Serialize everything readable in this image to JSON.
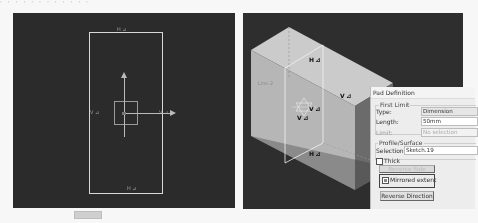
{
  "top_strip": {
    "text": "· · · · · ·   · · · · · ·"
  },
  "sketch_view": {
    "labels": {
      "top": "H ⊿",
      "left": "V ⊿",
      "right": "V ⊿",
      "bottom": "H ⊿"
    },
    "icons": [
      "axis-system-icon",
      "origin-square-icon"
    ]
  },
  "model_view": {
    "face_label": "Line.2",
    "constraints": {
      "top": "H ⊿",
      "right": "V ⊿",
      "center_a": "V ⊿",
      "center_b": "V ⊿",
      "bottom": "H ⊿"
    },
    "colors": {
      "background": "#2e2e2e",
      "top_face": "#c8c8c8",
      "front_face": "#b5b5b5",
      "side_face": "#6a6a6a"
    }
  },
  "pad_dialog": {
    "title": "Pad Definition",
    "first_limit": {
      "legend": "First Limit",
      "type_label": "Type:",
      "type_value": "Dimension",
      "length_label": "Length:",
      "length_value": "50mm",
      "limit_label": "Limit:",
      "limit_value": "No selection"
    },
    "profile_surface": {
      "legend": "Profile/Surface",
      "selection_label": "Selection:",
      "selection_value": "Sketch.19",
      "thick_label": "Thick",
      "thick_checked": false
    },
    "reverse_side_label": "Reverse Side",
    "mirrored_extent_label": "Mirrored extent",
    "mirrored_extent_checked": true,
    "reverse_direction_label": "Reverse Direction"
  }
}
